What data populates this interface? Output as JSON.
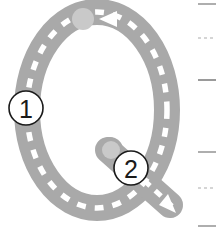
{
  "worksheet": {
    "title": "Letter Q tracing guide",
    "letter": "Q",
    "background_color": "#ffffff",
    "letter_fill_color": "#a9a9a9",
    "trace_path_color": "#ffffff",
    "start_dot_color": "#c9c9c9",
    "arrow_color": "#ffffff",
    "marker_circle_fill": "#ffffff",
    "marker_circle_stroke": "#1a1a1a",
    "marker_text_color": "#1a1a1a"
  },
  "strokes": [
    {
      "id": "stroke-1",
      "number": "1",
      "marker_x": 26,
      "marker_y": 108,
      "start_dot_x": 83,
      "start_dot_y": 19,
      "description": "oval body, counter-clockwise from top"
    },
    {
      "id": "stroke-2",
      "number": "2",
      "marker_x": 131,
      "marker_y": 168,
      "start_dot_x": 111,
      "start_dot_y": 150,
      "description": "tail, down and to the right"
    }
  ],
  "arrows": [
    {
      "id": "arrow-stroke-1",
      "direction": "left",
      "x": 108,
      "y": 19
    },
    {
      "id": "arrow-stroke-2",
      "direction": "down-right",
      "x": 167,
      "y": 201
    }
  ],
  "rule_lines": [
    {
      "id": "rule-line-top",
      "style": "solid",
      "y": 4,
      "color": "#9a9a9a"
    },
    {
      "id": "rule-line-midline-1",
      "style": "dashed",
      "y": 38,
      "color": "#c4c4c4"
    },
    {
      "id": "rule-line-baseline-1",
      "style": "solid",
      "y": 80,
      "color": "#9a9a9a"
    },
    {
      "id": "rule-line-baseline-2",
      "style": "solid",
      "y": 152,
      "color": "#9a9a9a"
    },
    {
      "id": "rule-line-midline-2",
      "style": "dashed",
      "y": 188,
      "color": "#c4c4c4"
    },
    {
      "id": "rule-line-bottom",
      "style": "solid",
      "y": 226,
      "color": "#9a9a9a"
    }
  ]
}
